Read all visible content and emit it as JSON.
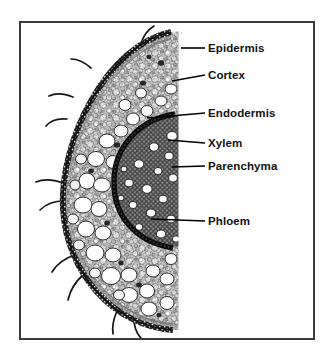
{
  "figure": {
    "kind": "labelled-micrograph",
    "frame_color": "#3a3a3a",
    "background_color": "#ffffff",
    "label_color": "#111111",
    "leader_color": "#000000"
  },
  "labels": [
    {
      "id": "epidermis",
      "text": "Epidermis",
      "text_x": 208,
      "text_y": 49,
      "leader": {
        "x1": 181,
        "y1": 48,
        "x2": 205,
        "y2": 48
      }
    },
    {
      "id": "cortex",
      "text": "Cortex",
      "text_x": 208,
      "text_y": 76,
      "leader": {
        "x1": 172,
        "y1": 81,
        "x2": 205,
        "y2": 75
      }
    },
    {
      "id": "endodermis",
      "text": "Endodermis",
      "text_x": 208,
      "text_y": 114,
      "leader": {
        "x1": 147,
        "y1": 118,
        "x2": 205,
        "y2": 113
      }
    },
    {
      "id": "xylem",
      "text": "Xylem",
      "text_x": 208,
      "text_y": 144,
      "leader": {
        "x1": 168,
        "y1": 140,
        "x2": 205,
        "y2": 143
      }
    },
    {
      "id": "parenchyma",
      "text": "Parenchyma",
      "text_x": 208,
      "text_y": 167,
      "leader": {
        "x1": 172,
        "y1": 167,
        "x2": 205,
        "y2": 166
      }
    },
    {
      "id": "phloem",
      "text": "Phloem",
      "text_x": 208,
      "text_y": 222,
      "leader": {
        "x1": 151,
        "y1": 219,
        "x2": 205,
        "y2": 221
      }
    }
  ],
  "structures": {
    "epidermis_label": "epidermis outer boundary",
    "cortex_label": "cortex parenchyma cells",
    "endodermis_label": "endodermis dark arc",
    "stele_label": "vascular cylinder",
    "xylem_vessels_label": "large xylem vessels",
    "root_hairs_label": "root hairs"
  }
}
